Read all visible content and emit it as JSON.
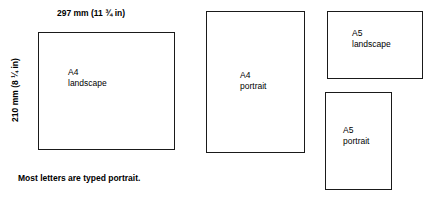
{
  "diagram": {
    "dimensions": {
      "width_label": "297 mm (11 ¾ in)",
      "height_label": "210 mm (8 ¼ in)"
    },
    "boxes": [
      {
        "id": "a4-landscape",
        "label": "A4\nlandscape"
      },
      {
        "id": "a4-portrait",
        "label": "A4\nportrait"
      },
      {
        "id": "a5-landscape",
        "label": "A5\nlandscape"
      },
      {
        "id": "a5-portrait",
        "label": "A5\nportrait"
      }
    ],
    "caption": "Most letters are typed portrait."
  }
}
